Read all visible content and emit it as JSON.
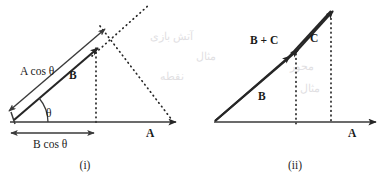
{
  "figure": {
    "background_color": "#ffffff",
    "ink_color": "#262626",
    "panels": [
      {
        "id": "panel-i",
        "caption": "(i)",
        "labels": {
          "vector_a": "A",
          "vector_b": "B",
          "a_cos_theta": "A cos θ",
          "b_cos_theta": "B cos θ",
          "angle": "θ"
        },
        "geometry": {
          "origin": [
            10,
            122
          ],
          "axis_a_end": [
            178,
            122
          ],
          "vector_b_tip": [
            96,
            50
          ],
          "a_cos_tip": [
            103,
            29
          ],
          "b_cos_foot": [
            96,
            132
          ],
          "angle_degrees": 40
        }
      },
      {
        "id": "panel-ii",
        "caption": "(ii)",
        "labels": {
          "vector_a": "A",
          "vector_b": "B",
          "vector_c": "C",
          "vector_b_plus_c": "B + C"
        },
        "geometry": {
          "origin": [
            214,
            122
          ],
          "axis_a_end": [
            378,
            122
          ],
          "vector_b_tip": [
            296,
            51
          ],
          "vector_bc_tip": [
            331,
            11
          ],
          "b_foot": [
            296,
            122
          ],
          "bc_foot": [
            331,
            122
          ]
        }
      }
    ],
    "bleed_text": [
      "آتش بازی",
      "مثال",
      "نقطه",
      "محور"
    ]
  }
}
